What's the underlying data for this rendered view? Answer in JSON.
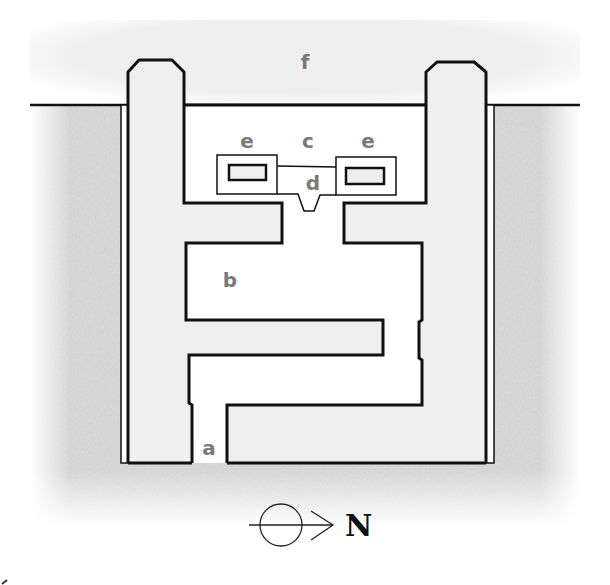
{
  "diagram": {
    "type": "architectural-plan",
    "labels": {
      "a": "a",
      "b": "b",
      "c": "c",
      "d": "d",
      "e_left": "e",
      "e_right": "e",
      "f": "f"
    },
    "compass": {
      "direction_label": "N",
      "symbol": "circle-with-arrow"
    },
    "colors": {
      "ground": "#d9d9d9",
      "open_area": "#eeeeee",
      "interior": "#ffffff",
      "walls": "#111111",
      "label_text": "#7a7a7a"
    }
  }
}
